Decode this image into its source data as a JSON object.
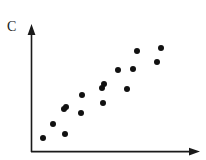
{
  "figure": {
    "width": 206,
    "height": 160,
    "background_color": "#ffffff",
    "ink_color": "#1a1a1a"
  },
  "axes": {
    "y_axis_label": "C",
    "x_axis_label": "",
    "origin": {
      "x": 31,
      "y": 152
    },
    "y_axis_top": {
      "x": 31,
      "y": 25
    },
    "x_axis_right": {
      "x": 200,
      "y": 152
    },
    "has_arrowheads": true,
    "has_ticks": false,
    "has_gridlines": false
  },
  "chart_data": {
    "type": "scatter",
    "title": "",
    "xlabel": "",
    "ylabel": "C",
    "xlim": [
      0,
      1
    ],
    "ylim": [
      0,
      1
    ],
    "grid": false,
    "legend": false,
    "marker": "filled-circle",
    "marker_color": "#111111",
    "marker_radius_px": 3,
    "n_points": 16,
    "points_px": [
      {
        "x": 43,
        "y": 138
      },
      {
        "x": 53,
        "y": 124
      },
      {
        "x": 65,
        "y": 134
      },
      {
        "x": 64,
        "y": 109
      },
      {
        "x": 66,
        "y": 107
      },
      {
        "x": 81,
        "y": 113
      },
      {
        "x": 82,
        "y": 95
      },
      {
        "x": 103,
        "y": 103
      },
      {
        "x": 102,
        "y": 88
      },
      {
        "x": 104,
        "y": 84
      },
      {
        "x": 118,
        "y": 70
      },
      {
        "x": 127,
        "y": 89
      },
      {
        "x": 133,
        "y": 69
      },
      {
        "x": 137,
        "y": 51
      },
      {
        "x": 157,
        "y": 62
      },
      {
        "x": 161,
        "y": 48
      }
    ],
    "x": [
      0.071,
      0.13,
      0.201,
      0.195,
      0.207,
      0.296,
      0.302,
      0.426,
      0.42,
      0.432,
      0.515,
      0.568,
      0.604,
      0.627,
      0.746,
      0.769
    ],
    "y": [
      0.11,
      0.22,
      0.142,
      0.339,
      0.354,
      0.307,
      0.449,
      0.386,
      0.504,
      0.535,
      0.646,
      0.496,
      0.654,
      0.795,
      0.709,
      0.819
    ]
  }
}
